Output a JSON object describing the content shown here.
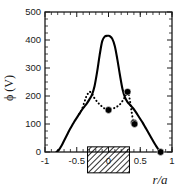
{
  "chart_data": {
    "type": "line",
    "title": "",
    "xlabel": "r/a",
    "ylabel": "ϕ (V)",
    "xlim": [
      -1,
      1
    ],
    "ylim": [
      0,
      500
    ],
    "xticks": [
      -1,
      -0.5,
      0,
      0.5,
      1
    ],
    "xticklabels": [
      "-1",
      "-0.5",
      "0",
      "0.5",
      "1"
    ],
    "yticks": [
      0,
      100,
      200,
      300,
      400,
      500
    ],
    "yticklabels": [
      "0",
      "100",
      "200",
      "300",
      "400",
      "500"
    ],
    "minor_ticks": true,
    "grid": false,
    "legend": null,
    "series": [
      {
        "name": "solid-profile",
        "style": "solid",
        "color": "#000000",
        "x": [
          -0.82,
          -0.78,
          -0.74,
          -0.7,
          -0.66,
          -0.62,
          -0.58,
          -0.54,
          -0.5,
          -0.46,
          -0.42,
          -0.38,
          -0.34,
          -0.3,
          -0.26,
          -0.22,
          -0.18,
          -0.14,
          -0.1,
          -0.06,
          -0.02,
          0.0,
          0.02,
          0.06,
          0.1,
          0.14,
          0.18,
          0.22,
          0.26,
          0.3,
          0.34,
          0.38,
          0.42,
          0.46,
          0.5,
          0.54,
          0.58,
          0.62,
          0.66,
          0.7,
          0.74,
          0.78,
          0.82
        ],
        "y": [
          0,
          8,
          22,
          40,
          58,
          76,
          92,
          108,
          122,
          136,
          150,
          162,
          174,
          188,
          205,
          235,
          285,
          345,
          395,
          412,
          415,
          415,
          414,
          404,
          378,
          330,
          275,
          225,
          195,
          178,
          168,
          158,
          146,
          132,
          118,
          104,
          88,
          72,
          56,
          40,
          25,
          11,
          0
        ]
      },
      {
        "name": "dotted-profile",
        "style": "dotted",
        "color": "#000000",
        "x": [
          -0.46,
          -0.42,
          -0.38,
          -0.35,
          -0.32,
          -0.3,
          -0.28,
          -0.25,
          -0.22,
          -0.18,
          -0.14,
          -0.1,
          -0.06,
          -0.02,
          0.0,
          0.02,
          0.06,
          0.1,
          0.14,
          0.18,
          0.22,
          0.26,
          0.29,
          0.3,
          0.32,
          0.34,
          0.36,
          0.38,
          0.4
        ],
        "y": [
          136,
          152,
          178,
          198,
          210,
          215,
          213,
          205,
          192,
          180,
          170,
          162,
          155,
          151,
          150,
          151,
          154,
          158,
          163,
          170,
          182,
          198,
          212,
          215,
          205,
          180,
          150,
          122,
          105
        ]
      }
    ],
    "points": [
      {
        "x": 0.0,
        "y": 150
      },
      {
        "x": 0.3,
        "y": 215
      },
      {
        "x": 0.4,
        "y": 105
      },
      {
        "x": 0.41,
        "y": 100
      },
      {
        "x": 0.82,
        "y": 0
      }
    ],
    "annotations": [
      {
        "type": "hatched-bar",
        "x_start": -0.33,
        "x_end": 0.33,
        "y": -28,
        "height": 26
      }
    ]
  }
}
